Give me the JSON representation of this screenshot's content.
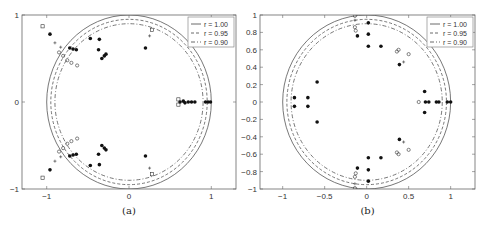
{
  "chart_data": [
    {
      "type": "scatter",
      "panel": "a",
      "caption": "(a)",
      "title": "",
      "xlabel": "",
      "ylabel": "",
      "xlim": [
        -1.3,
        1.3
      ],
      "ylim": [
        -1,
        1
      ],
      "xticks": [
        -1,
        0,
        1
      ],
      "xtick_labels": [
        "−1",
        "0",
        "1"
      ],
      "yticks": [
        -1,
        0,
        1
      ],
      "ytick_labels": [
        "−1",
        "0",
        "1"
      ],
      "grid": false,
      "legend_position": "upper right",
      "legend": [
        {
          "label": "r = 1.00",
          "style": "solid"
        },
        {
          "label": "r = 0.95",
          "style": "dashed"
        },
        {
          "label": "r = 0.90",
          "style": "dashdot"
        }
      ],
      "circles": [
        {
          "r": 1.0,
          "style": "solid"
        },
        {
          "r": 0.95,
          "style": "dashed"
        },
        {
          "r": 0.9,
          "style": "dashdot"
        }
      ],
      "series": [
        {
          "name": "filled",
          "marker": "dot",
          "points": [
            [
              -0.47,
              0.73
            ],
            [
              -0.36,
              0.72
            ],
            [
              -0.37,
              0.6
            ],
            [
              -0.3,
              0.53
            ],
            [
              -0.33,
              0.5
            ],
            [
              -0.28,
              0.55
            ],
            [
              -0.47,
              -0.73
            ],
            [
              -0.36,
              -0.72
            ],
            [
              -0.37,
              -0.6
            ],
            [
              -0.3,
              -0.53
            ],
            [
              -0.33,
              -0.5
            ],
            [
              -0.28,
              -0.55
            ],
            [
              -0.72,
              0.62
            ],
            [
              -0.68,
              0.61
            ],
            [
              -0.64,
              0.6
            ],
            [
              -0.72,
              -0.62
            ],
            [
              -0.68,
              -0.61
            ],
            [
              -0.64,
              -0.6
            ],
            [
              0.2,
              0.62
            ],
            [
              0.2,
              -0.62
            ],
            [
              0.62,
              0.0
            ],
            [
              0.66,
              0.01
            ],
            [
              0.68,
              -0.01
            ],
            [
              0.72,
              0.0
            ],
            [
              0.76,
              0.0
            ],
            [
              0.8,
              0.0
            ],
            [
              0.93,
              0.0
            ],
            [
              0.96,
              0.0
            ],
            [
              0.99,
              0.0
            ],
            [
              -0.96,
              0.78
            ],
            [
              -0.96,
              -0.78
            ]
          ]
        },
        {
          "name": "open-square",
          "marker": "square",
          "points": [
            [
              -1.05,
              0.87
            ],
            [
              -1.05,
              -0.87
            ],
            [
              0.28,
              0.83
            ],
            [
              0.28,
              -0.83
            ],
            [
              0.6,
              0.03
            ],
            [
              0.6,
              -0.03
            ]
          ]
        },
        {
          "name": "open-circle",
          "marker": "circle",
          "points": [
            [
              -0.85,
              0.57
            ],
            [
              -0.8,
              0.53
            ],
            [
              -0.75,
              0.48
            ],
            [
              -0.7,
              0.45
            ],
            [
              -0.63,
              0.42
            ],
            [
              -0.85,
              -0.57
            ],
            [
              -0.8,
              -0.53
            ],
            [
              -0.75,
              -0.48
            ],
            [
              -0.7,
              -0.45
            ],
            [
              -0.63,
              -0.42
            ]
          ]
        },
        {
          "name": "plus",
          "marker": "plus",
          "points": [
            [
              -0.9,
              0.68
            ],
            [
              -0.83,
              0.63
            ],
            [
              -0.9,
              -0.68
            ],
            [
              -0.83,
              -0.63
            ],
            [
              0.25,
              0.76
            ],
            [
              0.25,
              -0.76
            ]
          ]
        }
      ]
    },
    {
      "type": "scatter",
      "panel": "b",
      "caption": "(b)",
      "title": "",
      "xlabel": "",
      "ylabel": "",
      "xlim": [
        -1.27,
        1.29
      ],
      "ylim": [
        -1,
        1
      ],
      "xticks": [
        -1,
        -0.5,
        0,
        0.5,
        1
      ],
      "xtick_labels": [
        "−1",
        "−0.5",
        "0",
        "0.5",
        "1"
      ],
      "yticks": [
        -1,
        -0.8,
        -0.6,
        -0.4,
        -0.2,
        0,
        0.2,
        0.4,
        0.6,
        0.8,
        1
      ],
      "ytick_labels": [
        "−1",
        "−0.8",
        "−0.6",
        "−0.4",
        "−0.2",
        "0",
        "0.2",
        "0.4",
        "0.6",
        "0.8",
        "1"
      ],
      "grid": false,
      "legend_position": "upper right",
      "legend": [
        {
          "label": "r = 1.00",
          "style": "solid"
        },
        {
          "label": "r = 0.95",
          "style": "dashed"
        },
        {
          "label": "r = 0.90",
          "style": "dashdot"
        }
      ],
      "circles": [
        {
          "r": 1.0,
          "style": "solid"
        },
        {
          "r": 0.95,
          "style": "dashed"
        },
        {
          "r": 0.9,
          "style": "dashdot"
        }
      ],
      "series": [
        {
          "name": "filled",
          "marker": "dot",
          "points": [
            [
              0.02,
              0.91
            ],
            [
              0.02,
              0.78
            ],
            [
              0.02,
              0.64
            ],
            [
              0.02,
              -0.91
            ],
            [
              0.02,
              -0.78
            ],
            [
              0.02,
              -0.64
            ],
            [
              0.17,
              0.64
            ],
            [
              0.17,
              -0.64
            ],
            [
              0.39,
              0.43
            ],
            [
              0.39,
              -0.43
            ],
            [
              -0.86,
              0.05
            ],
            [
              -0.86,
              -0.05
            ],
            [
              -0.7,
              0.05
            ],
            [
              -0.7,
              -0.05
            ],
            [
              -0.59,
              0.23
            ],
            [
              -0.59,
              -0.23
            ],
            [
              0.69,
              0.12
            ],
            [
              0.69,
              -0.12
            ],
            [
              0.7,
              0.0
            ],
            [
              0.74,
              0.0
            ],
            [
              0.83,
              0.0
            ],
            [
              0.86,
              0.0
            ],
            [
              0.96,
              0.0
            ],
            [
              1.0,
              0.0
            ],
            [
              -0.11,
              0.76
            ],
            [
              -0.11,
              -0.76
            ]
          ]
        },
        {
          "name": "open-circle",
          "marker": "circle",
          "points": [
            [
              -0.14,
              0.86
            ],
            [
              -0.13,
              0.82
            ],
            [
              -0.14,
              -0.86
            ],
            [
              -0.13,
              -0.82
            ],
            [
              0.36,
              0.58
            ],
            [
              0.38,
              0.6
            ],
            [
              0.36,
              -0.58
            ],
            [
              0.38,
              -0.6
            ],
            [
              0.5,
              0.55
            ],
            [
              0.5,
              -0.55
            ],
            [
              0.62,
              0.0
            ],
            [
              -0.14,
              0.99
            ],
            [
              -0.14,
              -0.99
            ]
          ]
        },
        {
          "name": "plus",
          "marker": "plus",
          "points": [
            [
              -0.14,
              0.94
            ],
            [
              -0.14,
              -0.94
            ],
            [
              0.44,
              0.46
            ],
            [
              0.44,
              -0.46
            ]
          ]
        }
      ]
    }
  ]
}
